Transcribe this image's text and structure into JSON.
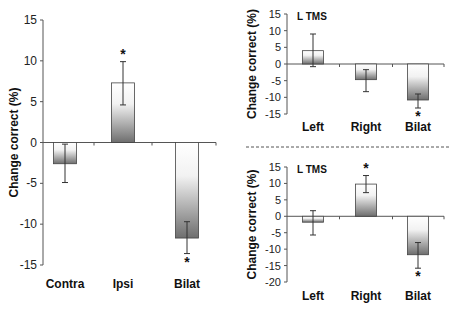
{
  "chart_data": [
    {
      "type": "bar",
      "title": "",
      "xlabel": "",
      "ylabel": "Change correct (%)",
      "categories": [
        "Contra",
        "Ipsi",
        "Bilat"
      ],
      "values": [
        -2.6,
        7.3,
        -11.7
      ],
      "error_low": [
        -4.9,
        4.6,
        -13.6
      ],
      "error_high": [
        -0.2,
        9.9,
        -9.7
      ],
      "significant": [
        false,
        true,
        true
      ],
      "ylim": [
        -15,
        15
      ],
      "yticks": [
        15,
        10,
        5,
        0,
        -5,
        -10,
        -15
      ],
      "annotation": "",
      "grid": false
    },
    {
      "type": "bar",
      "title": "",
      "xlabel": "",
      "ylabel": "Change correct (%)",
      "categories": [
        "Left",
        "Right",
        "Bilat"
      ],
      "values": [
        4.0,
        -4.7,
        -10.8
      ],
      "error_low": [
        -0.8,
        -8.3,
        -13.2
      ],
      "error_high": [
        9.0,
        -1.7,
        -9.0
      ],
      "significant": [
        false,
        false,
        true
      ],
      "ylim": [
        -15,
        15
      ],
      "yticks": [
        15,
        10,
        5,
        0,
        -5,
        -10,
        -15
      ],
      "annotation": "L TMS",
      "grid": false
    },
    {
      "type": "bar",
      "title": "",
      "xlabel": "",
      "ylabel": "Change correct (%)",
      "categories": [
        "Left",
        "Right",
        "Bilat"
      ],
      "values": [
        -1.8,
        9.8,
        -11.7
      ],
      "error_low": [
        -5.7,
        7.2,
        -15.8
      ],
      "error_high": [
        1.7,
        12.4,
        -8.0
      ],
      "significant": [
        false,
        true,
        true
      ],
      "ylim": [
        -20,
        15
      ],
      "yticks": [
        15,
        10,
        5,
        0,
        -5,
        -10,
        -15,
        -20
      ],
      "annotation": "L TMS",
      "grid": false
    }
  ],
  "layout": [
    {
      "axis_x": 43,
      "y_top": 20,
      "y_bottom": 265,
      "x_end": 216,
      "bar_centers": [
        65,
        123,
        187
      ],
      "bar_width": 23,
      "cat_y": 288,
      "ylab_x": 18,
      "tick_class": "tick"
    },
    {
      "axis_x": 287,
      "y_top": 14,
      "y_bottom": 114,
      "x_end": 444,
      "bar_centers": [
        313,
        366,
        418
      ],
      "bar_width": 21,
      "cat_y": 131,
      "ylab_x": 256,
      "tick_class": "tick-sm"
    },
    {
      "axis_x": 287,
      "y_top": 167,
      "y_bottom": 282,
      "x_end": 444,
      "bar_centers": [
        313,
        366,
        418
      ],
      "bar_width": 21,
      "cat_y": 300,
      "ylab_x": 256,
      "tick_class": "tick-sm"
    }
  ],
  "divider": {
    "y": 147,
    "x1": 246,
    "x2": 450,
    "color": "#555555"
  },
  "colors": {
    "bar_dark": "#6e6e6e",
    "bar_light": "#ffffff",
    "axis": "#555555"
  }
}
